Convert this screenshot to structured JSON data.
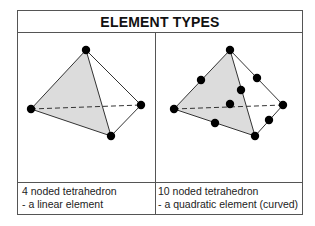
{
  "title": "ELEMENT TYPES",
  "colors": {
    "border": "#555555",
    "face_fill": "#dcdcdc",
    "node": "#000000",
    "edge": "#333333"
  },
  "panels": [
    {
      "name": "linear-tetrahedron",
      "caption_line1": "4 noded tetrahedron",
      "caption_line2": "- a linear element",
      "node_count": 4
    },
    {
      "name": "quadratic-tetrahedron",
      "caption_line1": "10 noded tetrahedron",
      "caption_line2": "- a quadratic element (curved)",
      "node_count": 10
    }
  ]
}
